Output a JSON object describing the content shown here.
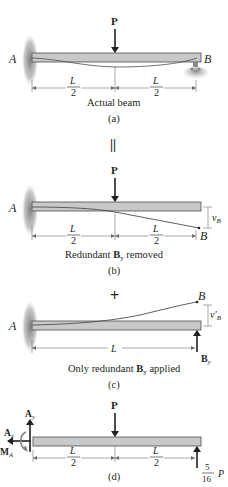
{
  "figure": {
    "panel_a": {
      "load_label": "P",
      "left_label": "A",
      "right_label": "B",
      "span_left_num": "L",
      "span_left_den": "2",
      "span_right_num": "L",
      "span_right_den": "2",
      "caption": "Actual beam",
      "tag": "(a)"
    },
    "equals_symbol": "||",
    "panel_b": {
      "load_label": "P",
      "left_label": "A",
      "right_label": "B",
      "deflection_label": "v",
      "deflection_sub": "B",
      "span_left_num": "L",
      "span_left_den": "2",
      "span_right_num": "L",
      "span_right_den": "2",
      "caption_pre": "Redundant ",
      "caption_bold": "B",
      "caption_sub": "y",
      "caption_post": " removed",
      "tag": "(b)"
    },
    "plus_symbol": "+",
    "panel_c": {
      "left_label": "A",
      "right_label": "B",
      "deflection_label": "v′",
      "deflection_sub": "B",
      "span_label": "L",
      "force_label": "B",
      "force_sub": "y",
      "caption_pre": "Only redundant ",
      "caption_bold": "B",
      "caption_sub": "y",
      "caption_post": " applied",
      "tag": "(c)"
    },
    "panel_d": {
      "load_label": "P",
      "ay_label": "A",
      "ay_sub": "y",
      "ax_label": "A",
      "ax_sub": "x",
      "ma_label": "M",
      "ma_sub": "A",
      "span_left_num": "L",
      "span_left_den": "2",
      "span_right_num": "L",
      "span_right_den": "2",
      "reaction_num": "5",
      "reaction_den": "16",
      "reaction_var": "P",
      "tag": "(d)"
    },
    "colors": {
      "beam_fill": "#c8c9cb",
      "beam_stroke": "#4d4d4f",
      "wall_shade": "#8c8c8c",
      "ink": "#231f20",
      "dim_line": "#6d6e71"
    }
  }
}
